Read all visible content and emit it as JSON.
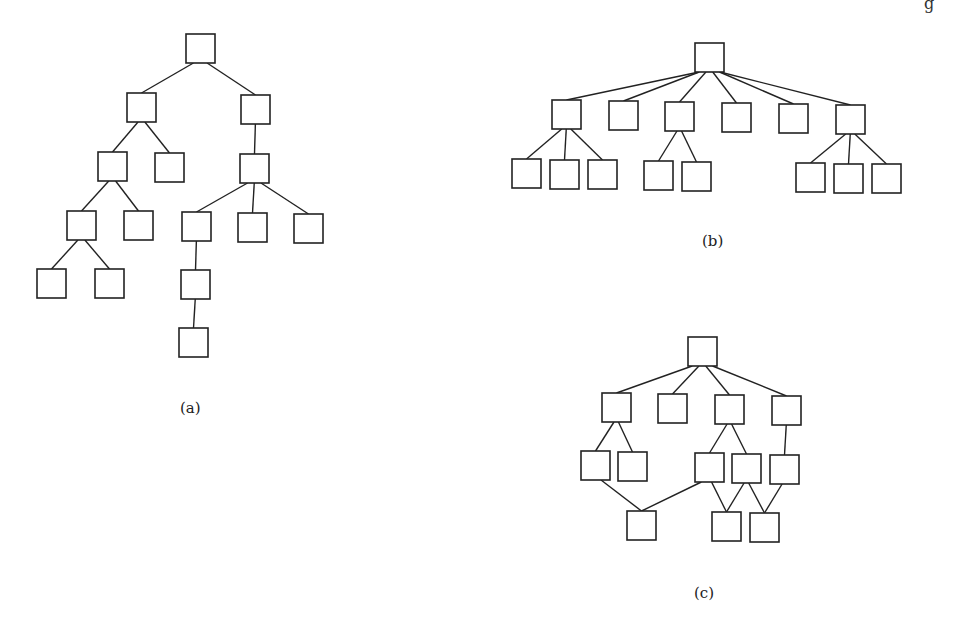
{
  "corner_text": "g",
  "figures": [
    {
      "id": "a",
      "label": "(a)",
      "label_pos": [
        180,
        399
      ],
      "nodes": [
        [
          186,
          34
        ],
        [
          127,
          93
        ],
        [
          241,
          95
        ],
        [
          98,
          152
        ],
        [
          155,
          153
        ],
        [
          240,
          154
        ],
        [
          67,
          211
        ],
        [
          124,
          211
        ],
        [
          182,
          212
        ],
        [
          238,
          213
        ],
        [
          294,
          214
        ],
        [
          37,
          269
        ],
        [
          95,
          269
        ],
        [
          181,
          270
        ],
        [
          179,
          328
        ]
      ],
      "edges": [
        [
          0,
          1
        ],
        [
          0,
          2
        ],
        [
          1,
          3
        ],
        [
          1,
          4
        ],
        [
          2,
          5
        ],
        [
          3,
          6
        ],
        [
          3,
          7
        ],
        [
          5,
          8
        ],
        [
          5,
          9
        ],
        [
          5,
          10
        ],
        [
          6,
          11
        ],
        [
          6,
          12
        ],
        [
          8,
          13
        ],
        [
          13,
          14
        ]
      ]
    },
    {
      "id": "b",
      "label": "(b)",
      "label_pos": [
        702,
        232
      ],
      "nodes": [
        [
          695,
          43
        ],
        [
          552,
          100
        ],
        [
          609,
          101
        ],
        [
          665,
          102
        ],
        [
          722,
          103
        ],
        [
          779,
          104
        ],
        [
          836,
          105
        ],
        [
          512,
          159
        ],
        [
          550,
          160
        ],
        [
          588,
          160
        ],
        [
          644,
          161
        ],
        [
          682,
          162
        ],
        [
          796,
          163
        ],
        [
          834,
          164
        ],
        [
          872,
          164
        ]
      ],
      "edges": [
        [
          0,
          1
        ],
        [
          0,
          2
        ],
        [
          0,
          3
        ],
        [
          0,
          4
        ],
        [
          0,
          5
        ],
        [
          0,
          6
        ],
        [
          1,
          7
        ],
        [
          1,
          8
        ],
        [
          1,
          9
        ],
        [
          3,
          10
        ],
        [
          3,
          11
        ],
        [
          6,
          12
        ],
        [
          6,
          13
        ],
        [
          6,
          14
        ]
      ]
    },
    {
      "id": "c",
      "label": "(c)",
      "label_pos": [
        694,
        584
      ],
      "nodes": [
        [
          688,
          337
        ],
        [
          602,
          393
        ],
        [
          658,
          394
        ],
        [
          715,
          395
        ],
        [
          772,
          396
        ],
        [
          581,
          451
        ],
        [
          618,
          452
        ],
        [
          695,
          453
        ],
        [
          732,
          454
        ],
        [
          770,
          455
        ],
        [
          627,
          511
        ],
        [
          712,
          512
        ],
        [
          750,
          513
        ]
      ],
      "edges": [
        [
          0,
          1
        ],
        [
          0,
          2
        ],
        [
          0,
          3
        ],
        [
          0,
          4
        ],
        [
          1,
          5
        ],
        [
          1,
          6
        ],
        [
          3,
          7
        ],
        [
          3,
          8
        ],
        [
          4,
          9
        ],
        [
          5,
          10
        ],
        [
          7,
          10
        ],
        [
          7,
          11
        ],
        [
          8,
          11
        ],
        [
          8,
          12
        ],
        [
          9,
          12
        ]
      ]
    }
  ],
  "node_size": 29
}
